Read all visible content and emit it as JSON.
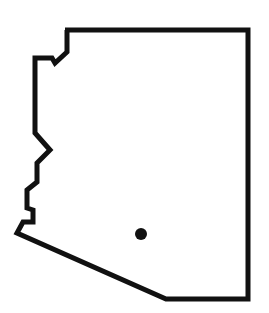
{
  "map": {
    "region": "Arizona",
    "outline_color": "#111111",
    "fill_color": "#ffffff",
    "stroke_width": 5,
    "outline_points": "65,30 248,30 248,299 166,299 17,233 23,222 33,222 33,210 27,208 27,190 37,182 37,163 50,150 35,133 35,58 52,58 55,63 67,52 67,30",
    "marker": {
      "cx": 141,
      "cy": 234,
      "r": 6,
      "color": "#111111"
    }
  }
}
